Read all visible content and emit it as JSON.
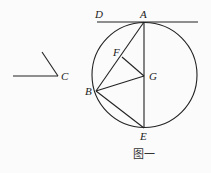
{
  "figure": {
    "caption": "图一",
    "stroke_color": "#222222",
    "background": "#fbfbfb"
  },
  "circle": {
    "cx": 144.5,
    "cy": 75,
    "r": 52.5
  },
  "points": {
    "A": {
      "label": "A",
      "x": 144,
      "y": 22
    },
    "B": {
      "label": "B",
      "x": 96,
      "y": 91
    },
    "C": {
      "label": "C",
      "x": 58,
      "y": 76
    },
    "D": {
      "label": "D",
      "x": 97,
      "y": 22
    },
    "E": {
      "label": "E",
      "x": 144,
      "y": 128
    },
    "F": {
      "label": "F",
      "x": 122,
      "y": 57
    },
    "G": {
      "label": "G",
      "x": 144,
      "y": 76
    }
  },
  "segments": [
    {
      "name": "tangent-line-DA",
      "x1": 97,
      "y1": 22,
      "x2": 198,
      "y2": 22
    },
    {
      "name": "diameter-AE",
      "x1": 144,
      "y1": 22,
      "x2": 144,
      "y2": 128
    },
    {
      "name": "chord-AB",
      "x1": 144,
      "y1": 22,
      "x2": 96,
      "y2": 91
    },
    {
      "name": "segment-BG",
      "x1": 96,
      "y1": 91,
      "x2": 144,
      "y2": 76
    },
    {
      "name": "segment-FG",
      "x1": 122,
      "y1": 57,
      "x2": 144,
      "y2": 76
    },
    {
      "name": "chord-BE",
      "x1": 96,
      "y1": 91,
      "x2": 144,
      "y2": 128
    },
    {
      "name": "angle-C-horizontal-ray",
      "x1": 13,
      "y1": 76,
      "x2": 58,
      "y2": 76
    },
    {
      "name": "angle-C-slanted-ray",
      "x1": 58,
      "y1": 76,
      "x2": 42,
      "y2": 52
    }
  ]
}
